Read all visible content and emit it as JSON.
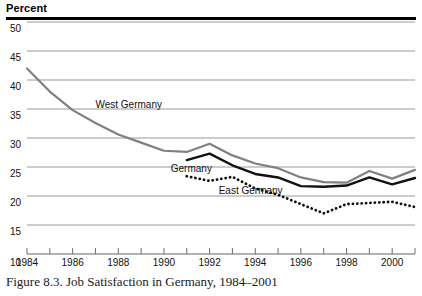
{
  "figure": {
    "y_axis_title": "Percent",
    "caption": "Figure 8.3.  Job Satisfaction in Germany, 1984–2001"
  },
  "chart_data": {
    "type": "line",
    "title": "Job Satisfaction in Germany, 1984–2001",
    "xlabel": "",
    "ylabel": "Percent",
    "ylim": [
      10,
      50
    ],
    "xlim": [
      1984,
      2001
    ],
    "yticks": [
      10,
      15,
      20,
      25,
      30,
      35,
      40,
      45,
      50
    ],
    "ytick_labels": [
      "10",
      "15",
      "20",
      "25",
      "30",
      "35",
      "40",
      "45",
      "50"
    ],
    "xticks": [
      1984,
      1985,
      1986,
      1987,
      1988,
      1989,
      1990,
      1991,
      1992,
      1993,
      1994,
      1995,
      1996,
      1997,
      1998,
      1999,
      2000,
      2001
    ],
    "xtick_labels": [
      "1984",
      "1986",
      "1988",
      "1990",
      "1992",
      "1994",
      "1996",
      "1998",
      "2000"
    ],
    "xtick_labeled_years": [
      1984,
      1986,
      1988,
      1990,
      1992,
      1994,
      1996,
      1998,
      2000
    ],
    "grid": true,
    "grid_axis": "y",
    "legend_position": "inline-annotations",
    "series": [
      {
        "name": "West Germany",
        "style": "solid",
        "color": "#808080",
        "width": 2.2,
        "x": [
          1984,
          1985,
          1986,
          1987,
          1988,
          1989,
          1990,
          1991,
          1992,
          1993,
          1994,
          1995,
          1996,
          1997,
          1998,
          1999,
          2000,
          2001
        ],
        "values": [
          42.0,
          38.0,
          34.8,
          32.6,
          30.6,
          29.2,
          27.8,
          27.6,
          29.0,
          27.0,
          25.6,
          24.8,
          23.2,
          22.4,
          22.3,
          24.3,
          23.0,
          24.5
        ]
      },
      {
        "name": "Germany",
        "style": "solid",
        "color": "#111111",
        "width": 2.4,
        "x": [
          1991,
          1992,
          1993,
          1994,
          1995,
          1996,
          1997,
          1998,
          1999,
          2000,
          2001
        ],
        "values": [
          26.2,
          27.3,
          25.3,
          23.8,
          23.2,
          21.7,
          21.6,
          21.8,
          23.2,
          22.0,
          23.1
        ]
      },
      {
        "name": "East Germany",
        "style": "dotted",
        "color": "#111111",
        "width": 2.4,
        "x": [
          1991,
          1992,
          1993,
          1994,
          1995,
          1996,
          1997,
          1998,
          1999,
          2000,
          2001
        ],
        "values": [
          23.4,
          22.6,
          23.3,
          21.3,
          20.2,
          18.6,
          17.0,
          18.6,
          18.8,
          19.0,
          18.1
        ]
      }
    ],
    "annotations": [
      {
        "text": "West Germany",
        "x": 1987.0,
        "y": 35.1
      },
      {
        "text": "Germany",
        "x": 1990.3,
        "y": 24.2
      },
      {
        "text": "East Germany",
        "x": 1992.4,
        "y": 20.4
      }
    ]
  }
}
